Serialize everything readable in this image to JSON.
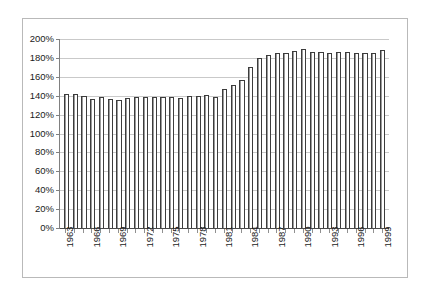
{
  "chart_data": {
    "type": "bar",
    "title": "",
    "subtitle": "",
    "xlabel": "",
    "ylabel": "",
    "ylim": [
      0,
      200
    ],
    "ytick_step": 20,
    "ytick_labels": [
      "200%",
      "180%",
      "160%",
      "140%",
      "120%",
      "100%",
      "80%",
      "60%",
      "40%",
      "20%",
      "0%"
    ],
    "ytick_values": [
      200,
      180,
      160,
      140,
      120,
      100,
      80,
      60,
      40,
      20,
      0
    ],
    "grid": "horizontal",
    "legend": "none",
    "xtick_label_interval": 3,
    "xtick_labels_shown": [
      "1963",
      "1966",
      "1969",
      "1972",
      "1975",
      "1978",
      "1981",
      "1984",
      "1987",
      "1990",
      "1993",
      "1996",
      "1999"
    ],
    "categories": [
      "1963",
      "1964",
      "1965",
      "1966",
      "1967",
      "1968",
      "1969",
      "1970",
      "1971",
      "1972",
      "1973",
      "1974",
      "1975",
      "1976",
      "1977",
      "1978",
      "1979",
      "1980",
      "1981",
      "1982",
      "1983",
      "1984",
      "1985",
      "1986",
      "1987",
      "1988",
      "1989",
      "1990",
      "1991",
      "1992",
      "1993",
      "1994",
      "1995",
      "1996",
      "1997",
      "1998",
      "1999"
    ],
    "values": [
      142,
      142,
      140,
      137,
      139,
      137,
      135,
      138,
      139,
      139,
      139,
      139,
      139,
      138,
      140,
      140,
      141,
      139,
      147,
      151,
      157,
      170,
      180,
      183,
      185,
      185,
      187,
      189,
      186,
      186,
      185,
      186,
      186,
      185,
      185,
      185,
      188
    ],
    "series": [
      {
        "name": "value",
        "values": [
          142,
          142,
          140,
          137,
          139,
          137,
          135,
          138,
          139,
          139,
          139,
          139,
          139,
          138,
          140,
          140,
          141,
          139,
          147,
          151,
          157,
          170,
          180,
          183,
          185,
          185,
          187,
          189,
          186,
          186,
          185,
          186,
          186,
          185,
          185,
          185,
          188
        ]
      }
    ],
    "colors": {
      "bar_fill": "#ffffff",
      "bar_outline": "#3c3c3c",
      "gridline": "#c9c9c9",
      "axis": "#808080",
      "frame": "#b9b9b9",
      "text": "#1a1a1a"
    }
  }
}
